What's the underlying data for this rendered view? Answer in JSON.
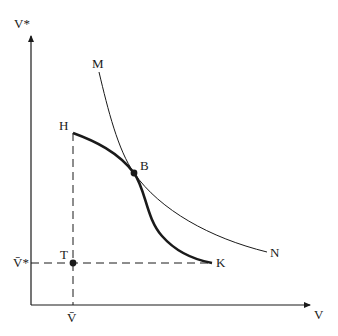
{
  "diagram": {
    "axes": {
      "y_label": "V*",
      "x_label": "V"
    },
    "ticks": {
      "x_tick_label": "V̄",
      "y_tick_label": "V̄*"
    },
    "curves": {
      "indifference_curve": {
        "start_label": "M",
        "end_label": "N"
      },
      "frontier_curve": {
        "start_label": "H",
        "end_label": "K"
      }
    },
    "points": {
      "tangency": {
        "label": "B"
      },
      "threat": {
        "label": "T"
      }
    },
    "colors": {
      "line": "#1a1a1a",
      "background": "#ffffff"
    }
  }
}
